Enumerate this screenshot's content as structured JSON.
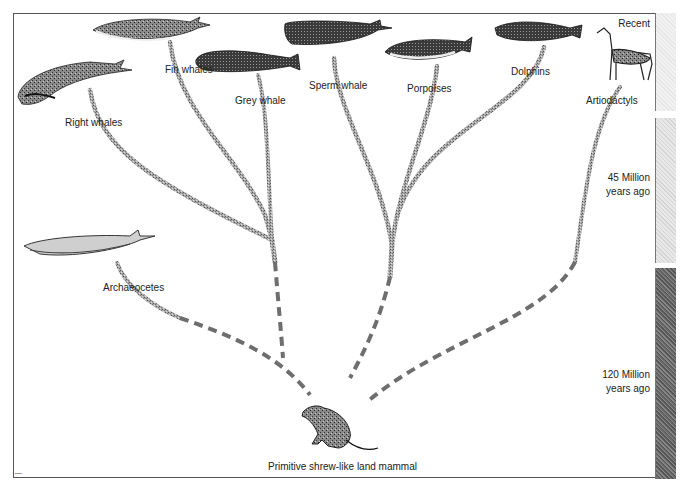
{
  "diagram": {
    "type": "phylogenetic-tree",
    "root": {
      "label": "Primitive shrew-like land mammal"
    },
    "taxa": [
      {
        "id": "right-whales",
        "label": "Right whales"
      },
      {
        "id": "fin-whales",
        "label": "Fin whales"
      },
      {
        "id": "grey-whale",
        "label": "Grey whale"
      },
      {
        "id": "sperm-whale",
        "label": "Sperm whale"
      },
      {
        "id": "porpoises",
        "label": "Porpoises"
      },
      {
        "id": "dolphins",
        "label": "Dolphins"
      },
      {
        "id": "artiodactyls",
        "label": "Artiodactyls"
      },
      {
        "id": "archaeocetes",
        "label": "Archaeocetes"
      }
    ],
    "timescale": [
      {
        "label": "Recent"
      },
      {
        "label_line1": "45 Million",
        "label_line2": "years ago"
      },
      {
        "label_line1": "120 Million",
        "label_line2": "years ago"
      }
    ],
    "colors": {
      "branch": "#9a9a9a",
      "branch_dark": "#6e6e6e",
      "frame": "#555555",
      "text": "#222222"
    }
  }
}
